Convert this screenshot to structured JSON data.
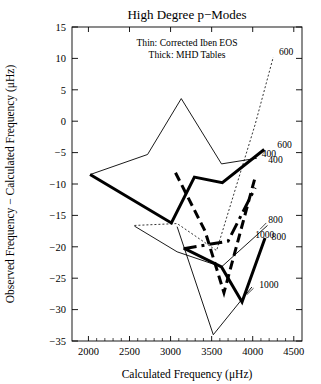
{
  "chart_data": {
    "type": "line",
    "title": "High Degree p−Modes",
    "xlabel": "Calculated Frequency (μHz)",
    "ylabel": "Observed Frequency − Calculated Frequency (μHz)",
    "xlim": [
      1800,
      4600
    ],
    "ylim": [
      -35,
      15
    ],
    "xticks": [
      2000,
      2500,
      3000,
      3500,
      4000,
      4500
    ],
    "xtick_labels": [
      "2000",
      "2500",
      "3000",
      "3500",
      "4000",
      "4500"
    ],
    "yticks": [
      -35,
      -30,
      -25,
      -20,
      -15,
      -10,
      -5,
      0,
      5,
      10,
      15
    ],
    "ytick_labels": [
      "−35",
      "−30",
      "−25",
      "−20",
      "−15",
      "−10",
      "−5",
      "0",
      "5",
      "10",
      "15"
    ],
    "grid": false,
    "legend_position": "upper-center",
    "legend_lines": [
      "Thin:  Corrected Iben EOS",
      "Thick: MHD Tables"
    ],
    "annotations": [
      {
        "label": "600",
        "x": 4320,
        "y": 10.6
      },
      {
        "label": "600",
        "x": 4300,
        "y": -4.2
      },
      {
        "label": "400",
        "x": 4110,
        "y": -5.7
      },
      {
        "label": "400",
        "x": 4190,
        "y": -6.6
      },
      {
        "label": "800",
        "x": 4190,
        "y": -16.2
      },
      {
        "label": "1000",
        "x": 4030,
        "y": -18.6
      },
      {
        "label": "800",
        "x": 4230,
        "y": -18.9
      },
      {
        "label": "1000",
        "x": 4080,
        "y": -26.6
      }
    ],
    "series": [
      {
        "name": "Corrected Iben EOS ℓ=600",
        "style": "thin-dotted",
        "width": 0.8,
        "dash": "2,2",
        "x": [
          2560,
          3080,
          3560,
          4030,
          4250
        ],
        "y": [
          -16.6,
          -16.3,
          -20.6,
          -0.5,
          10.2
        ]
      },
      {
        "name": "Corrected Iben EOS ℓ=400",
        "style": "thin-solid",
        "width": 0.9,
        "dash": "none",
        "x": [
          2020,
          2720,
          3130,
          3620,
          4050
        ],
        "y": [
          -8.5,
          -5.3,
          3.6,
          -6.8,
          -5.9
        ]
      },
      {
        "name": "Corrected Iben EOS ℓ=800",
        "style": "thin-solid",
        "width": 0.9,
        "dash": "none",
        "x": [
          2560,
          3080,
          3620,
          4180
        ],
        "y": [
          -16.7,
          -20.8,
          -23.2,
          -16.6
        ]
      },
      {
        "name": "Corrected Iben EOS ℓ=1000",
        "style": "thin-solid",
        "width": 0.9,
        "dash": "none",
        "x": [
          3080,
          3520,
          3990
        ],
        "y": [
          -16.8,
          -34.0,
          -26.4
        ]
      },
      {
        "name": "MHD Tables ℓ=400",
        "style": "thick-solid",
        "width": 3.0,
        "dash": "none",
        "x": [
          2020,
          3010,
          3290,
          3630,
          4140
        ],
        "y": [
          -8.5,
          -16.2,
          -8.9,
          -9.8,
          -4.5
        ]
      },
      {
        "name": "MHD Tables ℓ=600",
        "style": "thick-dashed",
        "width": 3.0,
        "dash": "9,5",
        "x": [
          3060,
          3420,
          3650,
          4030
        ],
        "y": [
          -8.2,
          -17.5,
          -27.3,
          -8.9
        ]
      },
      {
        "name": "MHD Tables ℓ=800",
        "style": "thick-solid",
        "width": 3.0,
        "dash": "none",
        "x": [
          3160,
          3620,
          3870,
          4150
        ],
        "y": [
          -20.2,
          -23.2,
          -28.8,
          -18.6
        ]
      },
      {
        "name": "MHD Tables ℓ=1000",
        "style": "thick-dashdot",
        "width": 3.0,
        "dash": "13,5,3,5",
        "x": [
          3160,
          3700,
          4030
        ],
        "y": [
          -20.3,
          -19.1,
          -10.6
        ]
      }
    ]
  },
  "axes_geometry": {
    "left_px": 72,
    "right_px": 302,
    "top_px": 27,
    "bottom_px": 341
  }
}
